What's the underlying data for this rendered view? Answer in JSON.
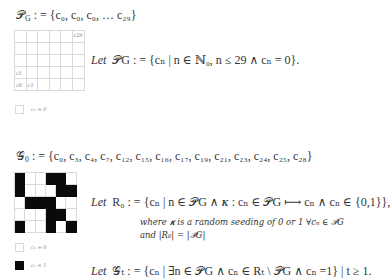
{
  "section1": {
    "set_definition": "𝒫G : = {c0, c0, c0, … c29}",
    "set_lhs": "𝒫",
    "set_lhs_sub": "G",
    "set_body": " : = {c₀, c₀, c₀, … c₂₉}",
    "grid": {
      "cols": 6,
      "rows": 5,
      "labels": {
        "top_right": "c29",
        "row1_col0": "c1",
        "row0_col0": "c0",
        "row0_col1": "c1"
      }
    },
    "statement": "Let 𝒫G : = {cn | n ∈ ℕ0, n ≤ 29 ∧ cn = 0}.",
    "statement_let": "Let",
    "statement_body": "𝒫G : = {cₙ | n ∈ ℕ₀, n ≤ 29 ∧ cₙ = 0}.",
    "legend": [
      {
        "swatch": "white",
        "label": "cₙ = 0"
      }
    ]
  },
  "section2": {
    "set_definition": "𝒢0 : = {c0, c3, c4, c7, c12, c15, c16, c17, c19, c21, c23, c24, c25, c28}",
    "set_lhs": "𝒢",
    "set_lhs_sub": "0",
    "set_body": " : = {c₀, c₃, c₄, c₇, c₁₂, c₁₅, c₁₆, c₁₇, c₁₉, c₂₁, c₂₃, c₂₄, c₂₅, c₂₈}",
    "grid": {
      "cols": 6,
      "rows": 5,
      "cells_top_to_bottom": [
        [
          1,
          0,
          0,
          1,
          1,
          0
        ],
        [
          1,
          0,
          0,
          0,
          1,
          1
        ],
        [
          0,
          1,
          1,
          1,
          0,
          0
        ],
        [
          0,
          0,
          0,
          1,
          1,
          0
        ],
        [
          1,
          0,
          0,
          1,
          0,
          1
        ]
      ]
    },
    "statement_let": "Let",
    "statement_body": "R₀ : = {cₙ | n ∈ 𝒫G ∧ 𝜿 : cₙ ∈ 𝒫G ⟼ cₙ ∧ cₙ ∈ {0,1}},",
    "where_line": "where 𝜿 is a random seeding of 0 or 1 ∀cₙ ∈ 𝒫G",
    "and_line": "and |R₀| = |𝒫G|",
    "legend": [
      {
        "swatch": "white",
        "label": "cₙ = 0"
      },
      {
        "swatch": "black",
        "label": "cₙ = 1"
      }
    ],
    "final_let": "Let",
    "final_body": "𝒢ₜ : = {cₙ | ∃n ∈ 𝒫G ∧ cₙ ∈ Rₜ \\ 𝒫G ∧ cₙ =1} | t ≥ 1."
  }
}
